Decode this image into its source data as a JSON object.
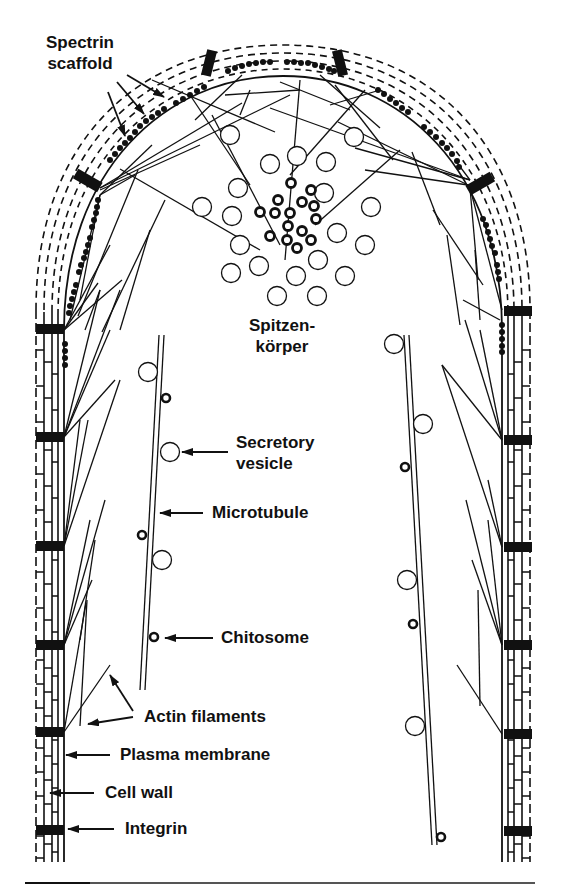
{
  "figure": {
    "colors": {
      "ink": "#111111",
      "background": "#ffffff"
    }
  },
  "labels": {
    "spectrin_scaffold_line1": "Spectrin",
    "spectrin_scaffold_line2": "scaffold",
    "spitzenkorper_line1": "Spitzen-",
    "spitzenkorper_line2": "körper",
    "secretory_vesicle_line1": "Secretory",
    "secretory_vesicle_line2": "vesicle",
    "microtubule": "Microtubule",
    "chitosome": "Chitosome",
    "actin_filaments": "Actin filaments",
    "plasma_membrane": "Plasma membrane",
    "cell_wall": "Cell wall",
    "integrin": "Integrin"
  }
}
